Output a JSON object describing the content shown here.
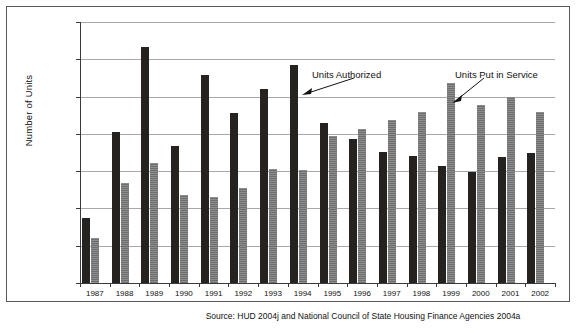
{
  "chart_data": {
    "type": "bar",
    "title": "",
    "subtitle": "",
    "xlabel": "",
    "ylabel": "Number of Units",
    "ylim": [
      0,
      140000
    ],
    "ytick_step": 20000,
    "ytick_labels": [
      "140,000",
      "120,000",
      "100,000",
      "80,000",
      "60,000",
      "40,000",
      "20,000",
      "0"
    ],
    "ytick_values": [
      140000,
      120000,
      100000,
      80000,
      60000,
      40000,
      20000,
      0
    ],
    "grid": true,
    "legend_position": "annotations-in-plot",
    "categories": [
      "1987",
      "1988",
      "1989",
      "1990",
      "1991",
      "1992",
      "1993",
      "1994",
      "1995",
      "1996",
      "1997",
      "1998",
      "1999",
      "2000",
      "2001",
      "2002"
    ],
    "series": [
      {
        "name": "Units Authorized",
        "color": "#262220",
        "values": [
          35000,
          81000,
          126500,
          73500,
          111500,
          91000,
          104000,
          117000,
          86000,
          77000,
          70500,
          68000,
          62500,
          59500,
          67500,
          69500
        ]
      },
      {
        "name": "Units Put in Service",
        "color": "#7d7d7d",
        "values": [
          24000,
          53500,
          64500,
          47000,
          46000,
          51000,
          61000,
          60500,
          79000,
          82500,
          87500,
          91500,
          107500,
          95500,
          100000,
          92000
        ]
      }
    ],
    "annotations": [
      {
        "text": "Units Authorized",
        "points_to": "1994 dark bar"
      },
      {
        "text": "Units Put in Service",
        "points_to": "1999 gray bar"
      }
    ]
  },
  "source": {
    "text": "Source: HUD 2004j and National Council of State Housing Finance Agencies 2004a"
  }
}
